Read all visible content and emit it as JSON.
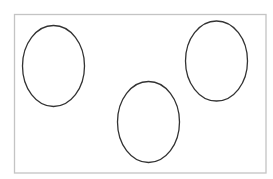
{
  "diagram": {
    "background": "#ffffff",
    "frame": {
      "x": 14.5,
      "y": 14.5,
      "width": 251.5,
      "height": 158.5,
      "stroke": "#c4c4c4",
      "stroke_width": 1.3
    },
    "shapes": [
      {
        "id": "ellipse-left",
        "type": "ellipse",
        "cx": 53.5,
        "cy": 66,
        "rx": 31,
        "ry": 40.5,
        "stroke": "#333333",
        "stroke_width": 1.3,
        "fill": "none"
      },
      {
        "id": "ellipse-middle",
        "type": "ellipse",
        "cx": 148.5,
        "cy": 122,
        "rx": 31,
        "ry": 40.5,
        "stroke": "#333333",
        "stroke_width": 1.3,
        "fill": "none"
      },
      {
        "id": "ellipse-right",
        "type": "ellipse",
        "cx": 216.5,
        "cy": 61,
        "rx": 31,
        "ry": 40,
        "stroke": "#333333",
        "stroke_width": 1.3,
        "fill": "none"
      }
    ]
  }
}
